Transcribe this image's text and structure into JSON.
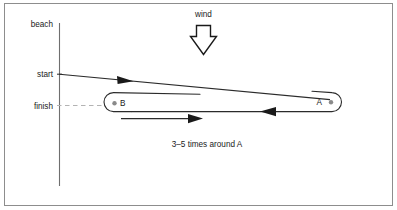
{
  "diagram": {
    "axis_labels": {
      "beach": "beach",
      "start": "start",
      "finish": "finish"
    },
    "wind": {
      "label": "wind",
      "direction": "down"
    },
    "marks": {
      "a_label": "A",
      "b_label": "B"
    },
    "caption": "3–5 times around A",
    "colors": {
      "ink": "#1a1a1a",
      "line": "#2b2b2b",
      "border": "#8d8d8d",
      "dash": "#b0b0b0",
      "background": "#ffffff"
    }
  }
}
